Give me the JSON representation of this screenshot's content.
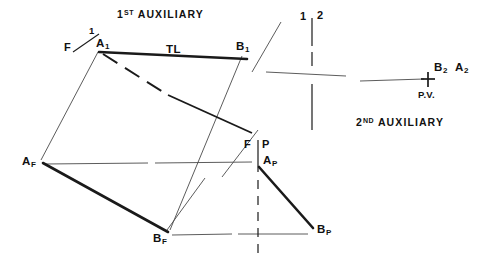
{
  "drawing": {
    "type": "descriptive-geometry-orthographic-projection",
    "background": "#ffffff",
    "ink": "#1a1a1a",
    "titles": {
      "first_auxiliary": "1ST AUXILIARY",
      "first_auxiliary_prefix": "1",
      "first_auxiliary_sup": "ST",
      "first_auxiliary_word": "AUXILIARY",
      "second_auxiliary": "2ND AUXILIARY",
      "second_auxiliary_prefix": "2",
      "second_auxiliary_sup": "ND",
      "second_auxiliary_word": "AUXILIARY"
    },
    "fold_lines": [
      {
        "name": "F-1",
        "left_label": "F",
        "right_label": "1",
        "at": [
          80,
          49
        ]
      },
      {
        "name": "1-2",
        "left_label": "1",
        "right_label": "2",
        "at": [
          312,
          18
        ]
      },
      {
        "name": "F-P",
        "left_label": "F",
        "right_label": "P",
        "at": [
          258,
          146
        ]
      }
    ],
    "points": [
      {
        "id": "A1",
        "base": "A",
        "sub": "1",
        "x": 96,
        "y": 44
      },
      {
        "id": "B1",
        "base": "B",
        "sub": "1",
        "x": 239,
        "y": 47
      },
      {
        "id": "AF",
        "base": "A",
        "sub": "F",
        "x": 28,
        "y": 163
      },
      {
        "id": "BF",
        "base": "B",
        "sub": "F",
        "x": 159,
        "y": 235
      },
      {
        "id": "AP",
        "base": "A",
        "sub": "P",
        "x": 266,
        "y": 160
      },
      {
        "id": "BP",
        "base": "B",
        "sub": "P",
        "x": 319,
        "y": 229
      },
      {
        "id": "B2",
        "base": "B",
        "sub": "2",
        "x": 438,
        "y": 70
      },
      {
        "id": "A2",
        "base": "A",
        "sub": "2",
        "x": 459,
        "y": 70
      }
    ],
    "annotations": [
      {
        "id": "TL",
        "label": "TL",
        "x": 172,
        "y": 52,
        "meaning": "true-length"
      },
      {
        "id": "PV",
        "label": "P.V.",
        "x": 428,
        "y": 100,
        "meaning": "point-view"
      }
    ],
    "marks": [
      {
        "id": "point-view-cross",
        "shape": "plus",
        "x": 428,
        "y": 79
      }
    ]
  }
}
